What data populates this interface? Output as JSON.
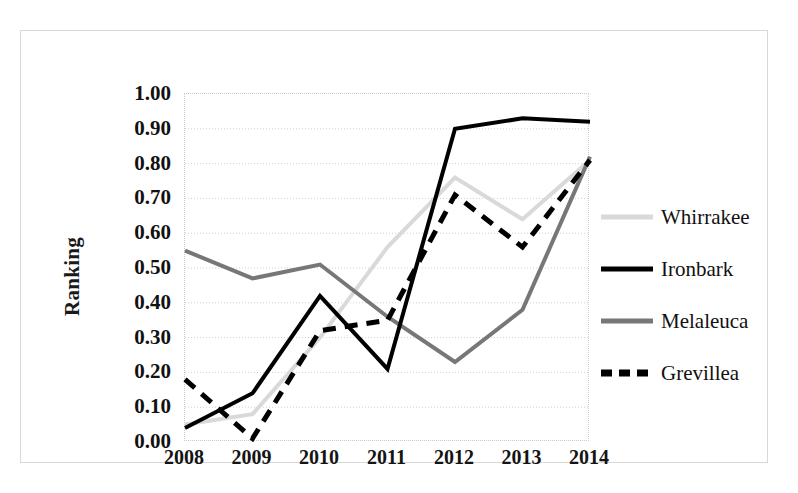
{
  "chart_data": {
    "type": "line",
    "title": "",
    "xlabel": "",
    "ylabel": "Ranking",
    "categories": [
      "2008",
      "2009",
      "2010",
      "2011",
      "2012",
      "2013",
      "2014"
    ],
    "x": [
      2008,
      2009,
      2010,
      2011,
      2012,
      2013,
      2014
    ],
    "ylim": [
      0.0,
      1.0
    ],
    "ytick_labels": [
      "1.00",
      "0.90",
      "0.80",
      "0.70",
      "0.60",
      "0.50",
      "0.40",
      "0.30",
      "0.20",
      "0.10",
      "0.00"
    ],
    "ytick_values": [
      1.0,
      0.9,
      0.8,
      0.7,
      0.6,
      0.5,
      0.4,
      0.3,
      0.2,
      0.1,
      0.0
    ],
    "grid": true,
    "legend_position": "right",
    "series": [
      {
        "name": "Whirrakee",
        "values": [
          0.05,
          0.08,
          0.3,
          0.56,
          0.76,
          0.64,
          0.81
        ],
        "color": "#d9d9d9",
        "style": "solid",
        "width": 4
      },
      {
        "name": "Ironbark",
        "values": [
          0.04,
          0.14,
          0.42,
          0.21,
          0.9,
          0.93,
          0.92
        ],
        "color": "#000000",
        "style": "solid",
        "width": 4
      },
      {
        "name": "Melaleuca",
        "values": [
          0.55,
          0.47,
          0.51,
          0.36,
          0.23,
          0.38,
          0.82
        ],
        "color": "#777777",
        "style": "solid",
        "width": 4
      },
      {
        "name": "Grevillea",
        "values": [
          0.18,
          0.01,
          0.32,
          0.35,
          0.71,
          0.56,
          0.81
        ],
        "color": "#000000",
        "style": "dashed",
        "width": 5
      }
    ]
  },
  "legend": {
    "items": [
      {
        "label": "Whirrakee"
      },
      {
        "label": "Ironbark"
      },
      {
        "label": "Melaleuca"
      },
      {
        "label": "Grevillea"
      }
    ]
  }
}
